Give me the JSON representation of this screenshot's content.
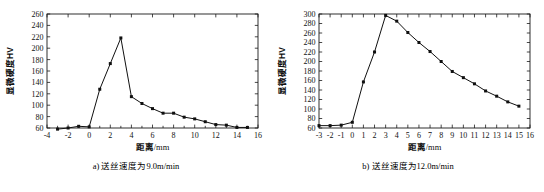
{
  "figure": {
    "panels": [
      {
        "id": "panel-a",
        "caption": "a) 送丝速度为9.0m/min",
        "chart_data": {
          "type": "line",
          "title": "",
          "xlabel": "距离/mm",
          "ylabel": "显微硬度HV",
          "xlim": [
            -4,
            16
          ],
          "ylim": [
            60,
            260
          ],
          "xticks": [
            -4,
            -2,
            0,
            2,
            4,
            6,
            8,
            10,
            12,
            14,
            16
          ],
          "yticks": [
            60,
            80,
            100,
            120,
            140,
            160,
            180,
            200,
            220,
            240,
            260
          ],
          "xticklabels": [
            "-4",
            "-2",
            "0",
            "2",
            "4",
            "6",
            "8",
            "10",
            "12",
            "14",
            "16"
          ],
          "yticklabels": [
            "60",
            "80",
            "100",
            "120",
            "140",
            "160",
            "180",
            "200",
            "220",
            "240",
            "260"
          ],
          "xminor_step": 1,
          "grid": false,
          "legend": "none",
          "marker": "square",
          "x": [
            -3,
            -2,
            -1,
            0,
            1,
            2,
            3,
            4,
            5,
            6,
            7,
            8,
            9,
            10,
            11,
            12,
            13,
            14,
            15
          ],
          "values": [
            58,
            60,
            63,
            62,
            128,
            173,
            218,
            115,
            103,
            94,
            86,
            86,
            79,
            76,
            71,
            66,
            65,
            61,
            61
          ]
        }
      },
      {
        "id": "panel-b",
        "caption": "b) 送丝速度为12.0m/min",
        "chart_data": {
          "type": "line",
          "title": "",
          "xlabel": "距离/mm",
          "ylabel": "显微硬度HV",
          "xlim": [
            -3,
            16
          ],
          "ylim": [
            60,
            300
          ],
          "xticks": [
            -3,
            -2,
            -1,
            0,
            1,
            2,
            3,
            4,
            5,
            6,
            7,
            8,
            9,
            10,
            11,
            12,
            13,
            14,
            15,
            16
          ],
          "yticks": [
            60,
            80,
            100,
            120,
            140,
            160,
            180,
            200,
            220,
            240,
            260,
            280,
            300
          ],
          "xticklabels": [
            "-3",
            "-2",
            "-1",
            "0",
            "1",
            "2",
            "3",
            "4",
            "5",
            "6",
            "7",
            "8",
            "9",
            "10",
            "11",
            "12",
            "13",
            "14",
            "15",
            "16"
          ],
          "yticklabels": [
            "60",
            "80",
            "100",
            "120",
            "140",
            "160",
            "180",
            "200",
            "220",
            "240",
            "260",
            "280",
            "300"
          ],
          "xminor_step": 1,
          "grid": false,
          "legend": "none",
          "marker": "square",
          "x": [
            -3,
            -2,
            -1,
            0,
            1,
            2,
            3,
            4,
            5,
            6,
            7,
            8,
            9,
            10,
            11,
            12,
            13,
            14,
            15
          ],
          "values": [
            65,
            65,
            66,
            72,
            157,
            220,
            297,
            285,
            261,
            240,
            221,
            200,
            179,
            166,
            153,
            138,
            127,
            115,
            106
          ]
        }
      }
    ]
  },
  "colors": {
    "line": "#101010",
    "axis": "#1a1a1a",
    "text": "#111111",
    "background": "#ffffff"
  }
}
